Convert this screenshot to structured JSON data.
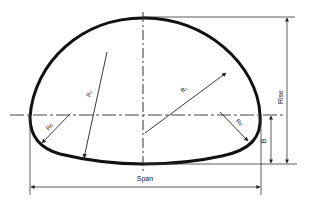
{
  "diagram": {
    "type": "pipe-arch cross-section",
    "labels": {
      "span": "Span",
      "rise": "Rise",
      "b": "B",
      "top_radius": "R₁",
      "side_radius": "R₂",
      "corner_radius_left": "Rc",
      "corner_radius_right": "Rc"
    },
    "colors": {
      "outline": "#111111",
      "dimension": "#333333",
      "background": "#ffffff"
    }
  }
}
